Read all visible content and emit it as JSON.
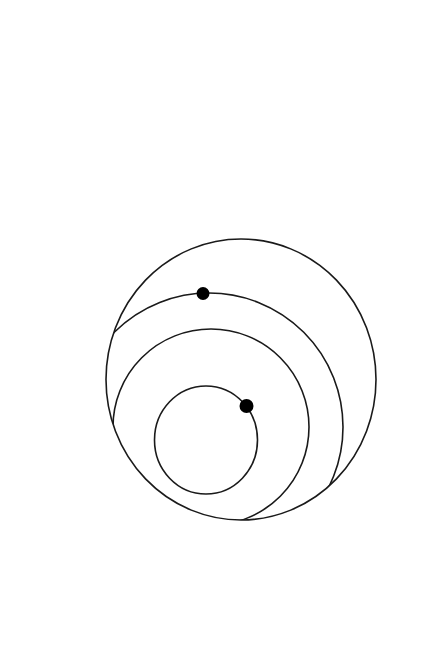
{
  "canvas": {
    "width": 432,
    "height": 651,
    "background": "#ffffff"
  },
  "diagram": {
    "type": "nested-circles",
    "stroke_color": "#1a1a1a",
    "dot_color": "#000000",
    "outer_circle": {
      "cx": 241,
      "cy": 379.5,
      "rx": 135,
      "ry": 140.5
    },
    "middle_circle": {
      "cx": 209,
      "cy": 427,
      "r": 134
    },
    "third_circle": {
      "cx": 211,
      "cy": 427,
      "r": 98
    },
    "inner_circle": {
      "cx": 206,
      "cy": 440,
      "rx": 51.5,
      "ry": 54
    },
    "dots": [
      {
        "name": "dot-on-middle-circle",
        "cx": 203,
        "cy": 293.5,
        "r": 6.5
      },
      {
        "name": "dot-on-inner-circle",
        "cx": 246.5,
        "cy": 406,
        "r": 7
      }
    ]
  }
}
